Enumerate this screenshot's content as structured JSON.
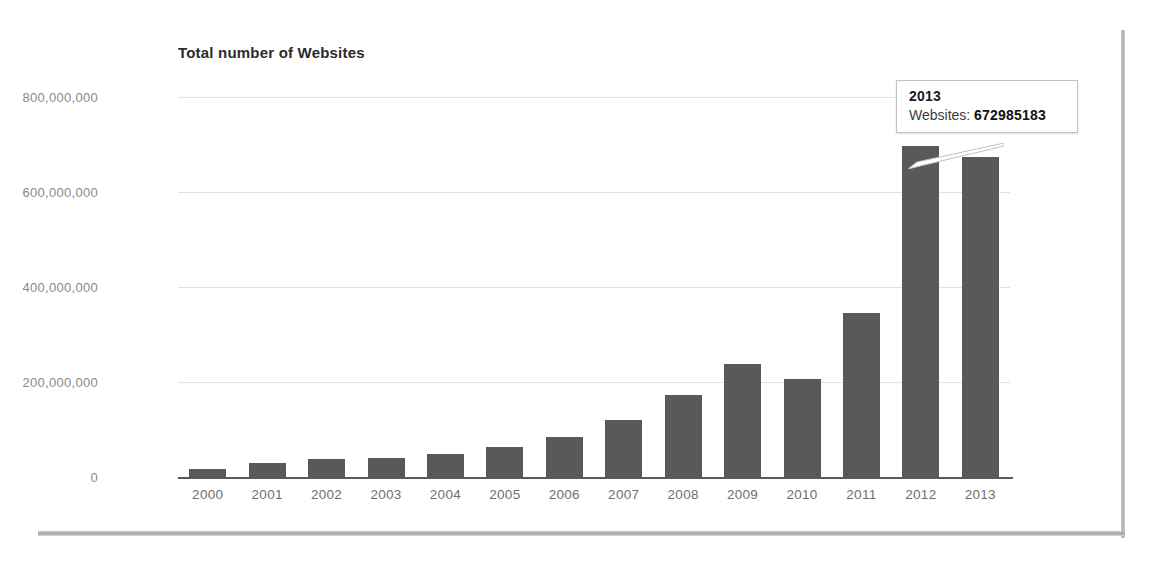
{
  "chart_data": {
    "type": "bar",
    "title": "Total number of Websites",
    "xlabel": "",
    "ylabel": "",
    "grid": true,
    "legend_position": "right",
    "legend": [
      "Websites"
    ],
    "legend_visible_fragment": "s",
    "ylim": [
      0,
      800000000
    ],
    "yticks": [
      0,
      200000000,
      400000000,
      600000000,
      800000000
    ],
    "ytick_labels": [
      "0",
      "200,000,000",
      "400,000,000",
      "600,000,000",
      "800,000,000"
    ],
    "categories": [
      "2000",
      "2001",
      "2002",
      "2003",
      "2004",
      "2005",
      "2006",
      "2007",
      "2008",
      "2009",
      "2010",
      "2011",
      "2012",
      "2013"
    ],
    "values": [
      17000000,
      29000000,
      38000000,
      40000000,
      49000000,
      64000000,
      85000000,
      121000000,
      172000000,
      238000000,
      207000000,
      346000000,
      697000000,
      672985183
    ],
    "series_name": "Websites",
    "bar_color": "#58595b"
  },
  "tooltip": {
    "title": "2013",
    "label": "Websites:",
    "value": "672985183",
    "target_category": "2013"
  }
}
